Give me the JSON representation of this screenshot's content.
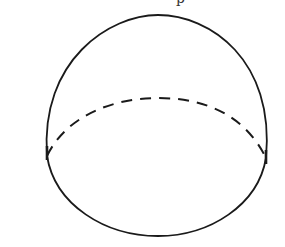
{
  "figure": {
    "caption_fragment": "p",
    "stroke_color": "#1a1a1a",
    "background": "#ffffff",
    "outline": {
      "cx": 156,
      "cy": 126,
      "rx": 111,
      "ry": 111
    },
    "base_ellipse": {
      "left_x": 47,
      "right_x": 266,
      "y": 156,
      "top_y": 98,
      "bottom_y": 236
    },
    "hidden_edge_style": "dashed"
  }
}
